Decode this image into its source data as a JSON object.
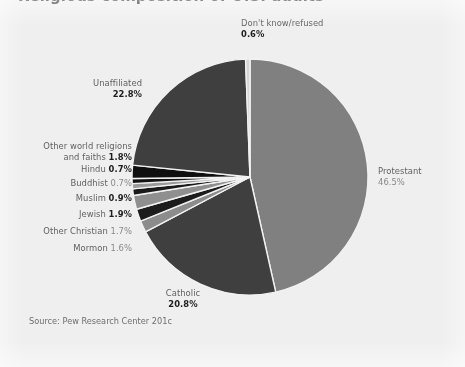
{
  "page": {
    "background_color": "#efefef",
    "cropped_title": "Religious composition of U.S. adults"
  },
  "source": {
    "text": "Source: Pew Research Center 201c"
  },
  "chart_data": {
    "type": "pie",
    "title": "",
    "subtitle": "",
    "xlabel": "",
    "ylabel": "",
    "legend_position": "callout-labels",
    "grid": false,
    "total": 100.0,
    "start_angle_deg": 0,
    "direction": "clockwise",
    "center": {
      "x": 250,
      "y": 177,
      "radius": 118
    },
    "categories": [
      "Protestant",
      "Catholic",
      "Mormon",
      "Other Christian",
      "Jewish",
      "Muslim",
      "Buddhist",
      "Hindu",
      "Other world religions and faiths",
      "Unaffiliated",
      "Don't know/refused"
    ],
    "values": [
      46.5,
      20.8,
      1.6,
      1.7,
      1.9,
      0.9,
      0.7,
      0.7,
      1.8,
      22.8,
      0.6
    ],
    "value_labels": [
      "46.5%",
      "20.8%",
      "1.6%",
      "1.7%",
      "1.9%",
      "0.9%",
      "0.7%",
      "0.7%",
      "1.8%",
      "22.8%",
      "0.6%"
    ],
    "colors": [
      "#808080",
      "#3f3f3f",
      "#8c8c8c",
      "#1c1c1c",
      "#8f8f8f",
      "#1a1a1a",
      "#9a9a9a",
      "#121212",
      "#0f0f0f",
      "#3f3f3f",
      "#d6d6d6"
    ],
    "separator_color": "#f2f2f2"
  },
  "slices": [
    {
      "key": "dont-know-refused",
      "name": "Don't know/refused",
      "percent": "0.6%",
      "value": 0.6,
      "color": "#d6d6d6",
      "emphasized": true
    },
    {
      "key": "protestant",
      "name": "Protestant",
      "percent": "46.5%",
      "value": 46.5,
      "color": "#808080",
      "emphasized": false
    },
    {
      "key": "catholic",
      "name": "Catholic",
      "percent": "20.8%",
      "value": 20.8,
      "color": "#3f3f3f",
      "emphasized": true
    },
    {
      "key": "mormon",
      "name": "Mormon",
      "percent": "1.6%",
      "value": 1.6,
      "color": "#8c8c8c",
      "emphasized": false
    },
    {
      "key": "other-christian",
      "name": "Other Christian",
      "percent": "1.7%",
      "value": 1.7,
      "color": "#1c1c1c",
      "emphasized": false
    },
    {
      "key": "jewish",
      "name": "Jewish",
      "percent": "1.9%",
      "value": 1.9,
      "color": "#8f8f8f",
      "emphasized": true
    },
    {
      "key": "muslim",
      "name": "Muslim",
      "percent": "0.9%",
      "value": 0.9,
      "color": "#1a1a1a",
      "emphasized": true
    },
    {
      "key": "buddhist",
      "name": "Buddhist",
      "percent": "0.7%",
      "value": 0.7,
      "color": "#9a9a9a",
      "emphasized": false
    },
    {
      "key": "hindu",
      "name": "Hindu",
      "percent": "0.7%",
      "value": 0.7,
      "color": "#121212",
      "emphasized": true
    },
    {
      "key": "other-world-religions",
      "name_line1": "Other world religions",
      "name_line2": "and faiths",
      "name": "Other world religions and faiths",
      "percent": "1.8%",
      "value": 1.8,
      "color": "#0f0f0f",
      "emphasized": true
    },
    {
      "key": "unaffiliated",
      "name": "Unaffiliated",
      "percent": "22.8%",
      "value": 22.8,
      "color": "#3f3f3f",
      "emphasized": true
    }
  ]
}
